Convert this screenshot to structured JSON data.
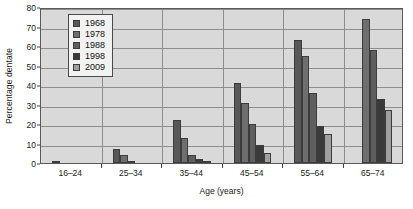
{
  "chart_data": {
    "type": "bar",
    "title": "",
    "xlabel": "Age (years)",
    "ylabel": "Percentage dentate",
    "categories": [
      "16–24",
      "25–34",
      "35–44",
      "45–54",
      "55–64",
      "65–74"
    ],
    "ylim": [
      0,
      80
    ],
    "yticks": [
      0,
      10,
      20,
      30,
      40,
      50,
      60,
      70,
      80
    ],
    "ytick_labels": [
      "0",
      "10",
      "20",
      "30",
      "40",
      "50",
      "60",
      "70",
      "80"
    ],
    "grid": true,
    "legend_position": "top-left-inside",
    "series": [
      {
        "name": "1968",
        "color": "#585858",
        "values": [
          1,
          7,
          22,
          41,
          63,
          0
        ]
      },
      {
        "name": "1978",
        "color": "#6e6e6e",
        "values": [
          0,
          4,
          13,
          31,
          55,
          74
        ]
      },
      {
        "name": "1988",
        "color": "#5f5f5f",
        "values": [
          0,
          1,
          4,
          20,
          36,
          58
        ]
      },
      {
        "name": "1998",
        "color": "#3a3a3a",
        "values": [
          0,
          0,
          2,
          9,
          19,
          33
        ]
      },
      {
        "name": "2009",
        "color": "#a0a0a0",
        "values": [
          0,
          0,
          1,
          5,
          15,
          27
        ]
      }
    ]
  },
  "legend": {
    "entries": [
      "1968",
      "1978",
      "1988",
      "1998",
      "2009"
    ]
  },
  "colors": {
    "plot_background": "#d9d9d9",
    "gridline": "#8d8d8d",
    "axis": "#5a5a5a",
    "text": "#1a1a1a",
    "legend_background": "#f2f2f2"
  }
}
